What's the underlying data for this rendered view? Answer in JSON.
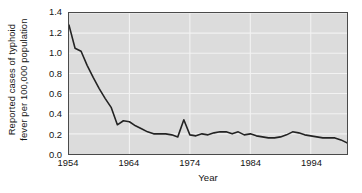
{
  "chart_data": {
    "type": "line",
    "title": "",
    "xlabel": "Year",
    "ylabel": "Reported cases of typhoid fever per 100,000 population",
    "ylabel_lines": [
      "Reported cases of typhoid",
      "fever per 100,000 population"
    ],
    "xlim": [
      1954,
      2000
    ],
    "ylim": [
      0.0,
      1.4
    ],
    "grid": true,
    "legend": "none",
    "line_color": "#232323",
    "plot_background": "#dcdcdc",
    "gridline_color": "#f2f2f2",
    "axis_color": "#4a4a4a",
    "ytick_labels": [
      "0.0",
      "0.2",
      "0.4",
      "0.6",
      "0.8",
      "1.0",
      "1.2",
      "1.4"
    ],
    "ytick_values": [
      0.0,
      0.2,
      0.4,
      0.6,
      0.8,
      1.0,
      1.2,
      1.4
    ],
    "xtick_labels": [
      "1954",
      "1964",
      "1974",
      "1984",
      "1994"
    ],
    "xtick_values": [
      1954,
      1964,
      1974,
      1984,
      1994
    ],
    "series": [
      {
        "name": "Reported typhoid fever cases per 100,000 population",
        "x": [
          1954,
          1955,
          1956,
          1957,
          1958,
          1959,
          1960,
          1961,
          1962,
          1963,
          1964,
          1965,
          1966,
          1967,
          1968,
          1969,
          1970,
          1971,
          1972,
          1973,
          1974,
          1975,
          1976,
          1977,
          1978,
          1979,
          1980,
          1981,
          1982,
          1983,
          1984,
          1985,
          1986,
          1987,
          1988,
          1989,
          1990,
          1991,
          1992,
          1993,
          1994,
          1995,
          1996,
          1997,
          1998,
          1999,
          2000
        ],
        "values": [
          1.28,
          1.05,
          1.02,
          0.88,
          0.76,
          0.65,
          0.55,
          0.46,
          0.29,
          0.33,
          0.32,
          0.28,
          0.25,
          0.22,
          0.2,
          0.2,
          0.2,
          0.19,
          0.17,
          0.34,
          0.19,
          0.18,
          0.2,
          0.19,
          0.21,
          0.22,
          0.22,
          0.2,
          0.22,
          0.19,
          0.2,
          0.18,
          0.17,
          0.16,
          0.16,
          0.17,
          0.19,
          0.22,
          0.21,
          0.19,
          0.18,
          0.17,
          0.16,
          0.16,
          0.16,
          0.14,
          0.11
        ]
      }
    ]
  }
}
